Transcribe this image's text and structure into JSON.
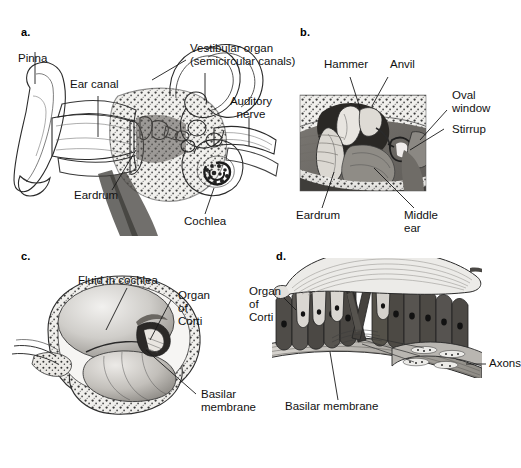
{
  "figure": {
    "background_color": "#ffffff",
    "type": "anatomical-illustration",
    "panels": [
      {
        "id": "a",
        "letter": "a.",
        "view": "Cutaway of outer, middle and inner ear",
        "labels": [
          {
            "name": "pinna",
            "text": "Pinna"
          },
          {
            "name": "ear-canal",
            "text": "Ear canal"
          },
          {
            "name": "vestibular-organ",
            "text": "Vestibular organ\n(semicircular canals)"
          },
          {
            "name": "auditory-nerve",
            "text": "Auditory\nnerve"
          },
          {
            "name": "eardrum",
            "text": "Eardrum"
          },
          {
            "name": "cochlea",
            "text": "Cochlea"
          }
        ]
      },
      {
        "id": "b",
        "letter": "b.",
        "view": "Close-up of the middle-ear ossicles",
        "labels": [
          {
            "name": "hammer",
            "text": "Hammer"
          },
          {
            "name": "anvil",
            "text": "Anvil"
          },
          {
            "name": "oval-window",
            "text": "Oval\nwindow"
          },
          {
            "name": "stirrup",
            "text": "Stirrup"
          },
          {
            "name": "eardrum",
            "text": "Eardrum"
          },
          {
            "name": "middle-ear",
            "text": "Middle\near"
          }
        ]
      },
      {
        "id": "c",
        "letter": "c.",
        "view": "Cross-section through one turn of the cochlea",
        "labels": [
          {
            "name": "fluid-in-cochlea",
            "text": "Fluid in cochlea"
          },
          {
            "name": "organ-of-corti",
            "text": "Organ\nof\nCorti"
          },
          {
            "name": "basilar-membrane",
            "text": "Basilar\nmembrane"
          }
        ]
      },
      {
        "id": "d",
        "letter": "d.",
        "view": "Detail of the organ of Corti with hair cells",
        "labels": [
          {
            "name": "organ-of-corti",
            "text": "Organ\nof\nCorti"
          },
          {
            "name": "axons",
            "text": "Axons"
          },
          {
            "name": "basilar-membrane",
            "text": "Basilar membrane"
          }
        ]
      }
    ]
  }
}
